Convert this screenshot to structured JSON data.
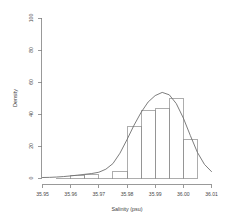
{
  "chart_data": {
    "type": "bar",
    "title": "",
    "subtitle": "",
    "xlabel": "Salinity (psu)",
    "ylabel": "Density",
    "xlim": [
      35.95,
      36.01
    ],
    "ylim": [
      0,
      100
    ],
    "grid": false,
    "legend": null,
    "bin_width": 0.005,
    "bin_edges": [
      35.955,
      35.96,
      35.965,
      35.97,
      35.975,
      35.98,
      35.985,
      35.99,
      35.995,
      36.0,
      36.005
    ],
    "categories": [
      "35.955-35.960",
      "35.960-35.965",
      "35.965-35.970",
      "35.970-35.975",
      "35.975-35.980",
      "35.980-35.985",
      "35.985-35.990",
      "35.990-35.995",
      "35.995-36.000",
      "36.000-36.005"
    ],
    "values": [
      0,
      1.5,
      2.5,
      0,
      4,
      32,
      42,
      43.5,
      50,
      24
    ],
    "xticks": [
      35.95,
      35.96,
      35.97,
      35.98,
      35.99,
      36.0,
      36.01
    ],
    "xticklabels": [
      "35.95",
      "35.96",
      "35.97",
      "35.98",
      "35.99",
      "36.00",
      "36.01"
    ],
    "yticks": [
      0,
      20,
      40,
      60,
      80,
      100
    ],
    "yticklabels": [
      "0",
      "20",
      "40",
      "60",
      "80",
      "100"
    ],
    "series": [
      {
        "name": "Histogram",
        "type": "bar",
        "values": [
          0,
          1.5,
          2.5,
          0,
          4,
          32,
          42,
          43.5,
          50,
          24
        ]
      },
      {
        "name": "Density estimate",
        "type": "line",
        "x": [
          35.95,
          35.9525,
          35.955,
          35.9575,
          35.96,
          35.9625,
          35.965,
          35.9675,
          35.97,
          35.9725,
          35.975,
          35.9775,
          35.98,
          35.9825,
          35.985,
          35.9875,
          35.99,
          35.9925,
          35.995,
          35.9975,
          36.0,
          36.0025,
          36.005,
          36.0075,
          36.01
        ],
        "y": [
          0.3,
          0.4,
          0.6,
          0.9,
          1.3,
          1.8,
          2.3,
          2.8,
          3.6,
          5.5,
          9.0,
          15.5,
          24.0,
          33.0,
          41.0,
          47.5,
          51.5,
          53.5,
          52.0,
          46.5,
          37.5,
          26.5,
          16.0,
          8.5,
          4.0
        ]
      }
    ],
    "colors": {
      "bar_stroke": "#8a8a8a",
      "curve": "#6e6e6e",
      "axis": "#808080",
      "text": "#4a4a4a",
      "background": "#ffffff"
    }
  },
  "axes": {
    "x_title": "Salinity (psu)",
    "y_title": "Density"
  }
}
